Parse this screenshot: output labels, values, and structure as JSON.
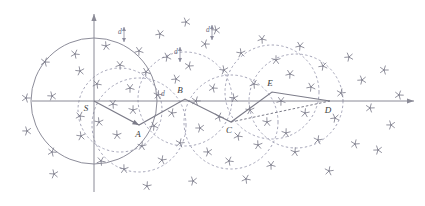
{
  "figure": {
    "background_color": "#ffffff",
    "line_color": "#7b7b88",
    "dashed_color": "#9b9bb0",
    "solid_circle_color": "#8d8d9a",
    "axis_color": "#8a8a96",
    "marker_color": "#7e7e8c",
    "label_color": "#3a3a3a",
    "width": 425,
    "height": 206
  },
  "axes": {
    "origin": {
      "x": 84,
      "y": 101
    },
    "x_axis": {
      "x1": 32,
      "y1": 101,
      "x2": 414,
      "y2": 101,
      "arrow": "right"
    },
    "y_axis": {
      "x1": 94,
      "y1": 192,
      "x2": 94,
      "y2": 14,
      "arrow": "up"
    }
  },
  "nodes": [
    {
      "id": "S",
      "label": "S",
      "x": 94,
      "y": 101,
      "label_dx": -8,
      "label_dy": 10
    },
    {
      "id": "A",
      "label": "A",
      "x": 139,
      "y": 125,
      "label_dx": -1,
      "label_dy": 12
    },
    {
      "id": "B",
      "label": "B",
      "x": 185,
      "y": 99,
      "label_dx": -5,
      "label_dy": -6
    },
    {
      "id": "C",
      "label": "C",
      "x": 231,
      "y": 122,
      "label_dx": -2,
      "label_dy": 11
    },
    {
      "id": "E",
      "label": "E",
      "x": 272,
      "y": 92,
      "label_dx": -2,
      "label_dy": -6
    },
    {
      "id": "D",
      "label": "D",
      "x": 330,
      "y": 101,
      "label_dx": -2,
      "label_dy": 12
    }
  ],
  "path_solid": {
    "name": "traversed-path",
    "points": "94,101 139,125 185,99 231,122 272,92 330,101",
    "arrow_targets": [
      "A"
    ]
  },
  "path_dashed": {
    "name": "alternate-path",
    "points": "231,122 330,101"
  },
  "solid_circle": {
    "name": "start-sensing-circle",
    "cx": 94,
    "cy": 101,
    "r": 63
  },
  "dashed_circles": [
    {
      "name": "circle-A",
      "cx": 139,
      "cy": 125,
      "r": 47
    },
    {
      "name": "circle-B",
      "cx": 185,
      "cy": 99,
      "r": 47
    },
    {
      "name": "circle-C",
      "cx": 231,
      "cy": 122,
      "r": 47
    },
    {
      "name": "circle-E",
      "cx": 272,
      "cy": 92,
      "r": 47
    },
    {
      "name": "circle-D",
      "cx": 296,
      "cy": 101,
      "r": 47
    },
    {
      "name": "circle-S-sub",
      "cx": 120,
      "cy": 110,
      "r": 42
    }
  ],
  "distance_labels": [
    {
      "id": "d1",
      "label": "d",
      "x": 124,
      "y": 32,
      "tick_x": 124,
      "tick_y1": 27,
      "tick_y2": 42
    },
    {
      "id": "d2",
      "label": "d",
      "x": 167,
      "y": 94,
      "tick_x": 0,
      "tick_y1": 0,
      "tick_y2": 0
    },
    {
      "id": "d3",
      "label": "d",
      "x": 180,
      "y": 52,
      "tick_x": 180,
      "tick_y1": 47,
      "tick_y2": 62
    },
    {
      "id": "d4",
      "label": "d",
      "x": 212,
      "y": 30,
      "tick_x": 212,
      "tick_y1": 25,
      "tick_y2": 40
    }
  ],
  "star_markers": {
    "name": "obstacle-markers",
    "count": 64,
    "radius": 4.3,
    "points": [
      [
        26,
        98
      ],
      [
        27,
        131
      ],
      [
        45,
        62
      ],
      [
        52,
        96
      ],
      [
        52,
        152
      ],
      [
        54,
        174
      ],
      [
        75,
        54
      ],
      [
        80,
        71
      ],
      [
        80,
        116
      ],
      [
        81,
        136
      ],
      [
        97,
        84
      ],
      [
        99,
        122
      ],
      [
        101,
        161
      ],
      [
        106,
        46
      ],
      [
        113,
        104
      ],
      [
        117,
        135
      ],
      [
        120,
        65
      ],
      [
        124,
        169
      ],
      [
        130,
        88
      ],
      [
        133,
        110
      ],
      [
        139,
        51
      ],
      [
        142,
        146
      ],
      [
        146,
        72
      ],
      [
        147,
        186
      ],
      [
        154,
        126
      ],
      [
        158,
        95
      ],
      [
        160,
        34
      ],
      [
        162,
        160
      ],
      [
        167,
        57
      ],
      [
        172,
        113
      ],
      [
        176,
        79
      ],
      [
        180,
        143
      ],
      [
        186,
        22
      ],
      [
        189,
        66
      ],
      [
        193,
        181
      ],
      [
        196,
        101
      ],
      [
        200,
        128
      ],
      [
        205,
        44
      ],
      [
        208,
        152
      ],
      [
        213,
        88
      ],
      [
        216,
        30
      ],
      [
        219,
        117
      ],
      [
        224,
        70
      ],
      [
        229,
        161
      ],
      [
        234,
        98
      ],
      [
        238,
        136
      ],
      [
        241,
        53
      ],
      [
        246,
        179
      ],
      [
        250,
        110
      ],
      [
        254,
        84
      ],
      [
        258,
        145
      ],
      [
        262,
        39
      ],
      [
        267,
        122
      ],
      [
        271,
        165
      ],
      [
        276,
        60
      ],
      [
        281,
        101
      ],
      [
        286,
        133
      ],
      [
        290,
        74
      ],
      [
        295,
        152
      ],
      [
        300,
        46
      ],
      [
        305,
        113
      ],
      [
        311,
        87
      ],
      [
        318,
        140
      ],
      [
        323,
        66
      ],
      [
        329,
        171
      ],
      [
        335,
        118
      ],
      [
        341,
        93
      ],
      [
        349,
        57
      ],
      [
        355,
        144
      ],
      [
        362,
        80
      ],
      [
        370,
        108
      ],
      [
        378,
        150
      ],
      [
        384,
        70
      ],
      [
        391,
        125
      ],
      [
        399,
        95
      ]
    ]
  }
}
